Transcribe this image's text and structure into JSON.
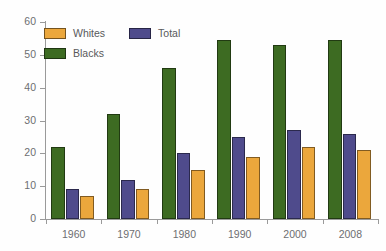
{
  "chart_data": {
    "type": "bar",
    "title": "",
    "subtitle": "",
    "xlabel": "",
    "ylabel": "",
    "categories": [
      "1960",
      "1970",
      "1980",
      "1990",
      "2000",
      "2008"
    ],
    "series": [
      {
        "name": "Blacks",
        "color": "#3d6b22",
        "values": [
          22,
          32,
          46,
          54.5,
          53,
          54.5
        ]
      },
      {
        "name": "Total",
        "color": "#4f4b8c",
        "values": [
          9,
          12,
          20,
          25,
          27,
          26
        ]
      },
      {
        "name": "Whites",
        "color": "#eba73c",
        "values": [
          7,
          9,
          15,
          19,
          22,
          21
        ]
      }
    ],
    "series_draw_order": [
      "Blacks",
      "Total",
      "Whites"
    ],
    "legend_order": [
      "Whites",
      "Total",
      "Blacks"
    ],
    "ylim": [
      0,
      60
    ],
    "yticks": [
      0,
      10,
      20,
      30,
      40,
      50,
      60
    ],
    "ytick_labels": [
      "0",
      "10",
      "20",
      "30",
      "40",
      "50",
      "60"
    ],
    "grid": false,
    "legend_position": "top-left-inside",
    "axis_color": "#9a9a9a",
    "tick_label_color": "#6d6e71",
    "background": "#ffffff"
  },
  "legend": {
    "items": [
      {
        "label": "Whites",
        "color": "#eba73c"
      },
      {
        "label": "Total",
        "color": "#4f4b8c"
      },
      {
        "label": "Blacks",
        "color": "#3d6b22"
      }
    ]
  }
}
